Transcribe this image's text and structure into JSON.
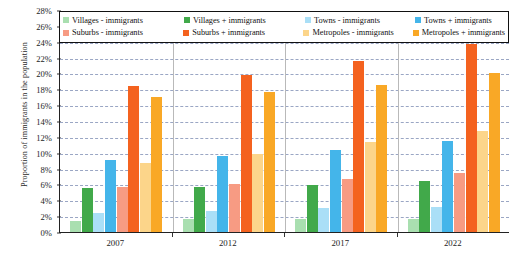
{
  "chart_data": {
    "type": "bar",
    "title": "",
    "xlabel": "",
    "ylabel": "Proportion of immigrants in the population",
    "categories": [
      "2007",
      "2012",
      "2017",
      "2022"
    ],
    "ylim": [
      0,
      28
    ],
    "ytick_step": 2,
    "ytick_labels": [
      "0%",
      "2%",
      "4%",
      "6%",
      "8%",
      "10%",
      "12%",
      "14%",
      "16%",
      "18%",
      "20%",
      "22%",
      "24%",
      "26%",
      "28%"
    ],
    "grid": true,
    "legend_position": "top-inside",
    "series": [
      {
        "name": "Villages - immigrants",
        "color": "#a9dfb0",
        "values": [
          1.4,
          1.6,
          1.7,
          1.7
        ]
      },
      {
        "name": "Villages + immigrants",
        "color": "#41a94a",
        "values": [
          5.6,
          5.7,
          5.9,
          6.4
        ]
      },
      {
        "name": "Towns - immigrants",
        "color": "#aadff7",
        "values": [
          2.4,
          2.6,
          3.0,
          3.2
        ]
      },
      {
        "name": "Towns + immigrants",
        "color": "#44b5ea",
        "values": [
          9.1,
          9.6,
          10.3,
          11.5
        ]
      },
      {
        "name": "Suburbs - immigrants",
        "color": "#f79b83",
        "values": [
          5.7,
          6.1,
          6.7,
          7.4
        ]
      },
      {
        "name": "Suburbs + immigrants",
        "color": "#f4621f",
        "values": [
          18.4,
          19.8,
          21.6,
          23.7
        ]
      },
      {
        "name": "Metropoles - immigrants",
        "color": "#fcd58a",
        "values": [
          8.7,
          9.8,
          11.3,
          12.8
        ]
      },
      {
        "name": "Metropoles + immigrants",
        "color": "#f9a826",
        "values": [
          17.0,
          17.7,
          18.6,
          20.0
        ]
      }
    ]
  },
  "legend": {
    "rows": [
      [
        "Villages - immigrants",
        "Villages + immigrants",
        "Towns - immigrants",
        "Towns + immigrants"
      ],
      [
        "Suburbs - immigrants",
        "Suburbs + immigrants",
        "Metropoles - immigrants",
        "Metropoles + immigrants"
      ]
    ]
  }
}
